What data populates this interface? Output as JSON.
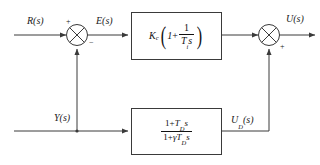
{
  "diagram": {
    "type": "control-system-block-diagram",
    "signals": {
      "reference_input": "R(s)",
      "error": "E(s)",
      "measured_output": "Y(s)",
      "control_output": "U(s)",
      "derivative_feedback": "U",
      "derivative_feedback_sub": "D",
      "derivative_feedback_tail": "(s)"
    },
    "summing_junctions": [
      {
        "name": "left-summing-junction",
        "input_sign": "+",
        "feedback_sign": "−"
      },
      {
        "name": "right-summing-junction",
        "feedback_sign": "+"
      }
    ],
    "blocks": [
      {
        "name": "pi-controller",
        "gain_symbol": "K",
        "gain_sub": "c",
        "one": "1",
        "plus": "+",
        "frac_num": "1",
        "frac_den_T": "T",
        "frac_den_sub": "i",
        "frac_den_s": "s"
      },
      {
        "name": "derivative-filter",
        "num_one": "1+",
        "num_T": "T",
        "num_sub": "D",
        "num_s": "s",
        "den_one": "1+",
        "den_gamma": "γ",
        "den_T": "T",
        "den_sub": "D",
        "den_s": "s"
      }
    ],
    "colors": {
      "line": "#3a3a3a",
      "text": "#1a1a1a",
      "background": "#ffffff"
    }
  }
}
